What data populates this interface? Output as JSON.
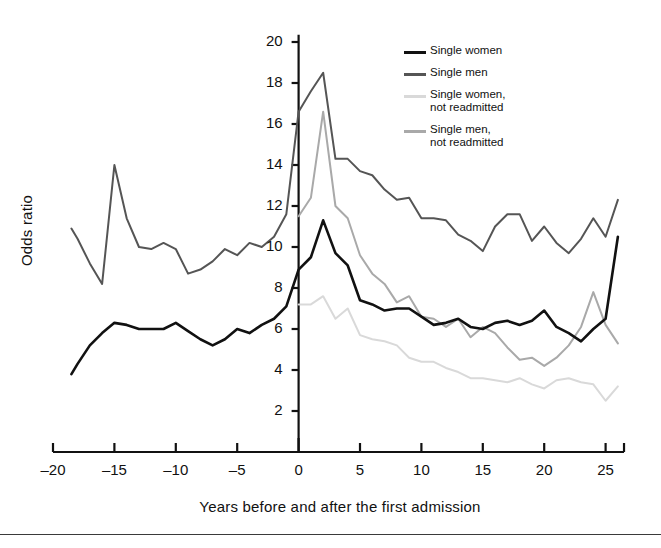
{
  "figure": {
    "background": "#ffffff",
    "bottom_rule_color": "#3a3a3a"
  },
  "axes": {
    "y_title": "Odds ratio",
    "x_title": "Years before and after the first admission",
    "y_ticks": [
      2,
      4,
      6,
      8,
      10,
      12,
      14,
      16,
      18,
      20
    ],
    "x_ticks": [
      -20,
      -15,
      -10,
      -5,
      0,
      5,
      10,
      15,
      20,
      25
    ],
    "x_tick_labels": [
      "–20",
      "–15",
      "–10",
      "–5",
      "0",
      "5",
      "10",
      "15",
      "20",
      "25"
    ],
    "axis_color": "#111111"
  },
  "legend": {
    "items": [
      {
        "label_line1": "Single women",
        "label_line2": "",
        "color": "#111111"
      },
      {
        "label_line1": "Single men",
        "label_line2": "",
        "color": "#555555"
      },
      {
        "label_line1": "Single women,",
        "label_line2": "not readmitted",
        "color": "#d9d9d9"
      },
      {
        "label_line1": "Single men,",
        "label_line2": "not readmitted",
        "color": "#a9a9a9"
      }
    ]
  },
  "chart_data": {
    "type": "line",
    "title": "",
    "xlabel": "Years before and after the first admission",
    "ylabel": "Odds ratio",
    "xlim": [
      -20,
      26.5
    ],
    "ylim": [
      0.8,
      20.6
    ],
    "grid": false,
    "legend_position": "top-right",
    "series": [
      {
        "name": "Single women",
        "color": "#111111",
        "x": [
          -18.5,
          -18,
          -17,
          -16,
          -15,
          -14,
          -13,
          -12,
          -11,
          -10,
          -9,
          -8,
          -7,
          -6,
          -5,
          -4,
          -3,
          -2,
          -1,
          0,
          1,
          2,
          3,
          4,
          5,
          6,
          7,
          8,
          9,
          10,
          11,
          12,
          13,
          14,
          15,
          16,
          17,
          18,
          19,
          20,
          21,
          22,
          23,
          24,
          25,
          26
        ],
        "y": [
          3.8,
          4.3,
          5.2,
          5.8,
          6.3,
          6.2,
          6.0,
          6.0,
          6.0,
          6.3,
          5.9,
          5.5,
          5.2,
          5.5,
          6.0,
          5.8,
          6.2,
          6.5,
          7.1,
          8.9,
          9.5,
          11.3,
          9.7,
          9.1,
          7.4,
          7.2,
          6.9,
          7.0,
          7.0,
          6.6,
          6.2,
          6.3,
          6.5,
          6.1,
          6.0,
          6.3,
          6.4,
          6.2,
          6.4,
          6.9,
          6.1,
          5.8,
          5.4,
          6.0,
          6.5,
          10.5
        ]
      },
      {
        "name": "Single men",
        "color": "#555555",
        "x": [
          -18.5,
          -18,
          -17,
          -16,
          -15,
          -14,
          -13,
          -12,
          -11,
          -10,
          -9,
          -8,
          -7,
          -6,
          -5,
          -4,
          -3,
          -2,
          -1,
          0,
          1,
          2,
          3,
          4,
          5,
          6,
          7,
          8,
          9,
          10,
          11,
          12,
          13,
          14,
          15,
          16,
          17,
          18,
          19,
          20,
          21,
          22,
          23,
          24,
          25,
          26
        ],
        "y": [
          10.9,
          10.4,
          9.2,
          8.2,
          14.0,
          11.4,
          10.0,
          9.9,
          10.2,
          9.9,
          8.7,
          8.9,
          9.3,
          9.9,
          9.6,
          10.2,
          10.0,
          10.5,
          11.6,
          16.6,
          17.6,
          18.5,
          14.3,
          14.3,
          13.7,
          13.5,
          12.8,
          12.3,
          12.4,
          11.4,
          11.4,
          11.3,
          10.6,
          10.3,
          9.8,
          11.0,
          11.6,
          11.6,
          10.3,
          11.0,
          10.2,
          9.7,
          10.4,
          11.4,
          10.5,
          12.3
        ]
      },
      {
        "name": "Single women, not readmitted",
        "color": "#d9d9d9",
        "x": [
          0,
          1,
          2,
          3,
          4,
          5,
          6,
          7,
          8,
          9,
          10,
          11,
          12,
          13,
          14,
          15,
          16,
          17,
          18,
          19,
          20,
          21,
          22,
          23,
          24,
          25,
          26
        ],
        "y": [
          7.2,
          7.2,
          7.6,
          6.5,
          7.0,
          5.7,
          5.5,
          5.4,
          5.2,
          4.6,
          4.4,
          4.4,
          4.1,
          3.9,
          3.6,
          3.6,
          3.5,
          3.4,
          3.6,
          3.3,
          3.1,
          3.5,
          3.6,
          3.4,
          3.3,
          2.5,
          3.2
        ]
      },
      {
        "name": "Single men, not readmitted",
        "color": "#a9a9a9",
        "x": [
          0,
          1,
          2,
          3,
          4,
          5,
          6,
          7,
          8,
          9,
          10,
          11,
          12,
          13,
          14,
          15,
          16,
          17,
          18,
          19,
          20,
          21,
          22,
          23,
          24,
          25,
          26
        ],
        "y": [
          11.5,
          12.4,
          16.6,
          12.0,
          11.4,
          9.6,
          8.7,
          8.2,
          7.3,
          7.6,
          6.6,
          6.5,
          6.1,
          6.5,
          5.6,
          6.1,
          5.8,
          5.1,
          4.5,
          4.6,
          4.2,
          4.6,
          5.2,
          6.1,
          7.8,
          6.2,
          5.3
        ]
      }
    ]
  }
}
